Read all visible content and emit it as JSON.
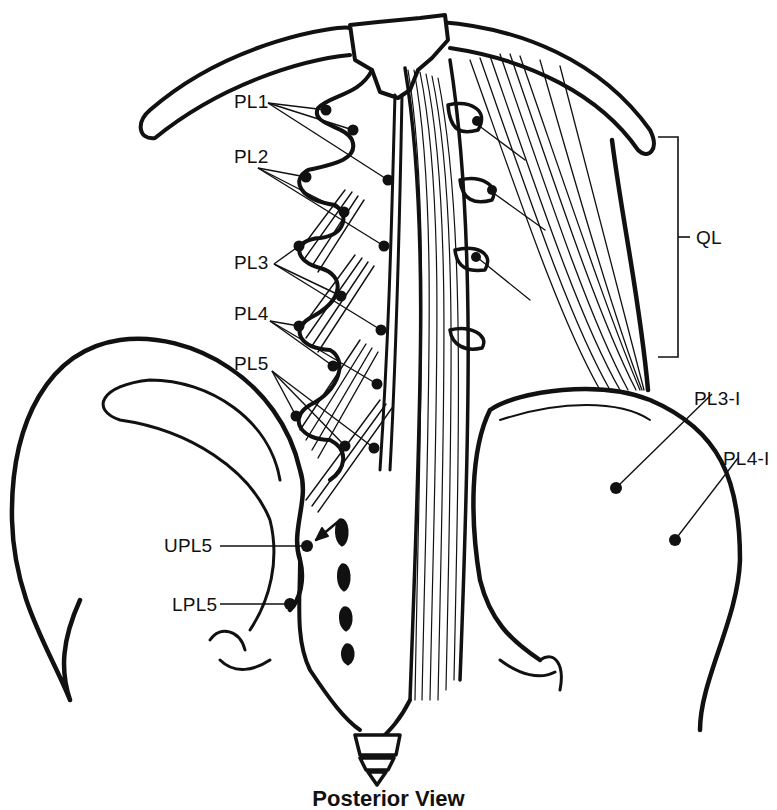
{
  "diagram": {
    "caption": "Posterior View",
    "ink_color": "#111111",
    "background": "#ffffff",
    "bracket": {
      "label": "QL",
      "x": 678,
      "top": 137,
      "bottom": 357,
      "tick_x": 660
    },
    "labels": [
      {
        "id": "PL1",
        "text": "PL1",
        "x": 234,
        "y": 101
      },
      {
        "id": "PL2",
        "text": "PL2",
        "x": 234,
        "y": 151
      },
      {
        "id": "PL3",
        "text": "PL3",
        "x": 234,
        "y": 255
      },
      {
        "id": "PL4",
        "text": "PL4",
        "x": 234,
        "y": 306
      },
      {
        "id": "PL5",
        "text": "PL5",
        "x": 234,
        "y": 356
      },
      {
        "id": "UPL5",
        "text": "UPL5",
        "x": 164,
        "y": 538
      },
      {
        "id": "LPL5",
        "text": "LPL5",
        "x": 172,
        "y": 596
      },
      {
        "id": "QL",
        "text": "QL",
        "x": 696,
        "y": 226
      },
      {
        "id": "PL3-I",
        "text": "PL3-I",
        "x": 694,
        "y": 388
      },
      {
        "id": "PL4-I",
        "text": "PL4-I",
        "x": 723,
        "y": 448
      }
    ],
    "points": [
      {
        "group": "PL1",
        "x": 326,
        "y": 110
      },
      {
        "group": "PL1",
        "x": 353,
        "y": 130
      },
      {
        "group": "PL1",
        "x": 388,
        "y": 180
      },
      {
        "group": "PL2",
        "x": 306,
        "y": 177
      },
      {
        "group": "PL2",
        "x": 344,
        "y": 212
      },
      {
        "group": "PL2",
        "x": 384,
        "y": 246
      },
      {
        "group": "PL3",
        "x": 299,
        "y": 246
      },
      {
        "group": "PL3",
        "x": 341,
        "y": 296
      },
      {
        "group": "PL3",
        "x": 381,
        "y": 330
      },
      {
        "group": "PL4",
        "x": 299,
        "y": 326
      },
      {
        "group": "PL4",
        "x": 333,
        "y": 366
      },
      {
        "group": "PL4",
        "x": 377,
        "y": 384
      },
      {
        "group": "PL5",
        "x": 296,
        "y": 416
      },
      {
        "group": "PL5",
        "x": 345,
        "y": 446
      },
      {
        "group": "PL5",
        "x": 374,
        "y": 448
      },
      {
        "group": "UPL5",
        "x": 307,
        "y": 546
      },
      {
        "group": "LPL5",
        "x": 290,
        "y": 604
      },
      {
        "group": "PL3-I",
        "x": 616,
        "y": 488
      },
      {
        "group": "PL4-I",
        "x": 675,
        "y": 540
      },
      {
        "group": "QL",
        "x": 477,
        "y": 121
      },
      {
        "group": "QL",
        "x": 492,
        "y": 190
      },
      {
        "group": "QL",
        "x": 476,
        "y": 257
      }
    ]
  }
}
